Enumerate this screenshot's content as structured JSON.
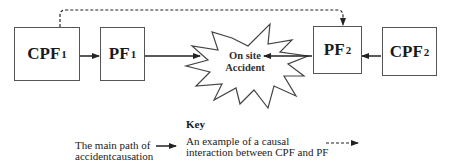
{
  "diagram": {
    "nodes": [
      {
        "id": "cpf1",
        "label": "CPF",
        "sub": "1"
      },
      {
        "id": "pf1",
        "label": "PF",
        "sub": "1"
      },
      {
        "id": "accident",
        "label_line1": "On site",
        "label_line2": "Accident"
      },
      {
        "id": "pf2",
        "label": "PF",
        "sub": "2"
      },
      {
        "id": "cpf2",
        "label": "CPF",
        "sub": "2"
      }
    ],
    "edges": [
      {
        "from": "cpf1",
        "to": "pf1",
        "style": "solid"
      },
      {
        "from": "pf1",
        "to": "accident",
        "style": "solid"
      },
      {
        "from": "pf2",
        "to": "accident",
        "style": "solid"
      },
      {
        "from": "cpf2",
        "to": "pf2",
        "style": "solid"
      },
      {
        "from": "cpf1",
        "to": "pf2",
        "style": "dashed"
      }
    ],
    "colors": {
      "line": "#222222",
      "box_border": "#555555",
      "background": "#ffffff"
    }
  },
  "key": {
    "title": "Key",
    "main_path_line1": "The main path of",
    "main_path_line2": "accidentcausation",
    "interaction_line1": "An example of a causal",
    "interaction_line2": "interaction between CPF and PF"
  }
}
